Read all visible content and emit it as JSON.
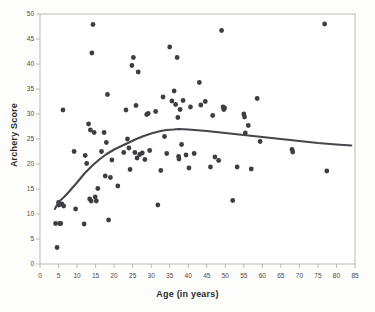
{
  "chart_data": {
    "type": "scatter",
    "title": "",
    "xlabel": "Age (in years)",
    "ylabel": "Archery Score",
    "xlim": [
      0,
      85
    ],
    "ylim": [
      0,
      50
    ],
    "xticks": [
      0,
      5,
      10,
      15,
      20,
      25,
      30,
      35,
      40,
      45,
      50,
      55,
      60,
      65,
      70,
      75,
      80,
      85
    ],
    "yticks": [
      0,
      5,
      10,
      15,
      20,
      25,
      30,
      35,
      40,
      45,
      50
    ],
    "grid": false,
    "legend": null,
    "point_color": "#3d3d42",
    "line_color": "#46464b",
    "frame_color": "#b9b9bc",
    "background": "#ffffff",
    "page_background": "#fdfdfb",
    "marker_radius": 2.4,
    "series": [
      {
        "name": "Archers",
        "type": "scatter",
        "points": [
          [
            4.2,
            8.1
          ],
          [
            4.6,
            3.3
          ],
          [
            5.0,
            12.3
          ],
          [
            5.1,
            11.8
          ],
          [
            5.3,
            8.1
          ],
          [
            5.6,
            8.1
          ],
          [
            5.9,
            12.0
          ],
          [
            6.2,
            30.8
          ],
          [
            6.4,
            11.6
          ],
          [
            9.2,
            22.5
          ],
          [
            9.6,
            11.0
          ],
          [
            11.9,
            8.0
          ],
          [
            12.2,
            21.7
          ],
          [
            12.6,
            20.1
          ],
          [
            13.1,
            28.0
          ],
          [
            13.4,
            13.0
          ],
          [
            13.6,
            26.8
          ],
          [
            13.8,
            12.6
          ],
          [
            14.0,
            42.2
          ],
          [
            14.3,
            47.9
          ],
          [
            14.6,
            26.3
          ],
          [
            14.9,
            13.4
          ],
          [
            15.2,
            12.6
          ],
          [
            15.6,
            15.1
          ],
          [
            16.6,
            22.5
          ],
          [
            17.3,
            26.3
          ],
          [
            17.6,
            17.6
          ],
          [
            17.9,
            24.3
          ],
          [
            18.2,
            33.9
          ],
          [
            18.5,
            8.8
          ],
          [
            19.0,
            17.3
          ],
          [
            19.4,
            20.8
          ],
          [
            21.0,
            15.6
          ],
          [
            22.6,
            22.3
          ],
          [
            23.2,
            30.8
          ],
          [
            23.6,
            25.0
          ],
          [
            24.0,
            23.2
          ],
          [
            24.3,
            18.9
          ],
          [
            24.8,
            39.7
          ],
          [
            25.2,
            41.3
          ],
          [
            25.6,
            22.3
          ],
          [
            25.9,
            31.7
          ],
          [
            26.2,
            21.2
          ],
          [
            26.5,
            38.4
          ],
          [
            26.9,
            21.9
          ],
          [
            27.6,
            22.2
          ],
          [
            28.3,
            20.9
          ],
          [
            28.8,
            29.9
          ],
          [
            29.2,
            30.1
          ],
          [
            29.6,
            22.7
          ],
          [
            31.2,
            30.5
          ],
          [
            31.8,
            11.8
          ],
          [
            32.6,
            18.7
          ],
          [
            33.2,
            33.4
          ],
          [
            33.6,
            25.5
          ],
          [
            34.2,
            22.1
          ],
          [
            35.0,
            43.4
          ],
          [
            35.6,
            32.6
          ],
          [
            36.2,
            34.6
          ],
          [
            36.6,
            31.9
          ],
          [
            37.0,
            41.3
          ],
          [
            37.2,
            29.3
          ],
          [
            37.4,
            21.5
          ],
          [
            37.5,
            21.0
          ],
          [
            37.8,
            30.9
          ],
          [
            38.2,
            23.9
          ],
          [
            38.6,
            32.7
          ],
          [
            39.4,
            21.8
          ],
          [
            40.2,
            19.2
          ],
          [
            40.6,
            31.4
          ],
          [
            41.6,
            22.1
          ],
          [
            43.0,
            36.3
          ],
          [
            43.4,
            31.8
          ],
          [
            44.6,
            32.5
          ],
          [
            46.0,
            19.4
          ],
          [
            46.6,
            29.7
          ],
          [
            47.2,
            21.4
          ],
          [
            48.2,
            20.7
          ],
          [
            49.0,
            46.7
          ],
          [
            49.4,
            31.4
          ],
          [
            49.6,
            30.9
          ],
          [
            49.8,
            31.2
          ],
          [
            52.0,
            12.7
          ],
          [
            53.2,
            19.4
          ],
          [
            55.0,
            30.0
          ],
          [
            55.2,
            29.4
          ],
          [
            55.4,
            26.2
          ],
          [
            56.2,
            27.7
          ],
          [
            57.0,
            19.0
          ],
          [
            58.6,
            33.1
          ],
          [
            59.4,
            24.5
          ],
          [
            68.0,
            22.9
          ],
          [
            68.2,
            22.4
          ],
          [
            76.8,
            48.0
          ],
          [
            77.4,
            18.6
          ]
        ]
      },
      {
        "name": "LOESS trend",
        "type": "line",
        "points": [
          [
            4.0,
            11.0
          ],
          [
            5.0,
            12.4
          ],
          [
            6.5,
            13.4
          ],
          [
            8.0,
            14.6
          ],
          [
            10.0,
            16.3
          ],
          [
            12.0,
            18.1
          ],
          [
            14.0,
            19.6
          ],
          [
            16.0,
            20.9
          ],
          [
            18.0,
            22.0
          ],
          [
            20.0,
            22.9
          ],
          [
            22.0,
            23.6
          ],
          [
            24.0,
            24.3
          ],
          [
            26.0,
            25.0
          ],
          [
            28.0,
            25.6
          ],
          [
            30.0,
            26.1
          ],
          [
            32.0,
            26.5
          ],
          [
            34.0,
            26.8
          ],
          [
            36.0,
            26.9
          ],
          [
            37.5,
            27.0
          ],
          [
            40.0,
            26.9
          ],
          [
            45.0,
            26.6
          ],
          [
            50.0,
            26.2
          ],
          [
            55.0,
            25.8
          ],
          [
            60.0,
            25.4
          ],
          [
            65.0,
            25.0
          ],
          [
            70.0,
            24.6
          ],
          [
            75.0,
            24.2
          ],
          [
            80.0,
            23.9
          ],
          [
            84.0,
            23.7
          ]
        ]
      }
    ]
  }
}
